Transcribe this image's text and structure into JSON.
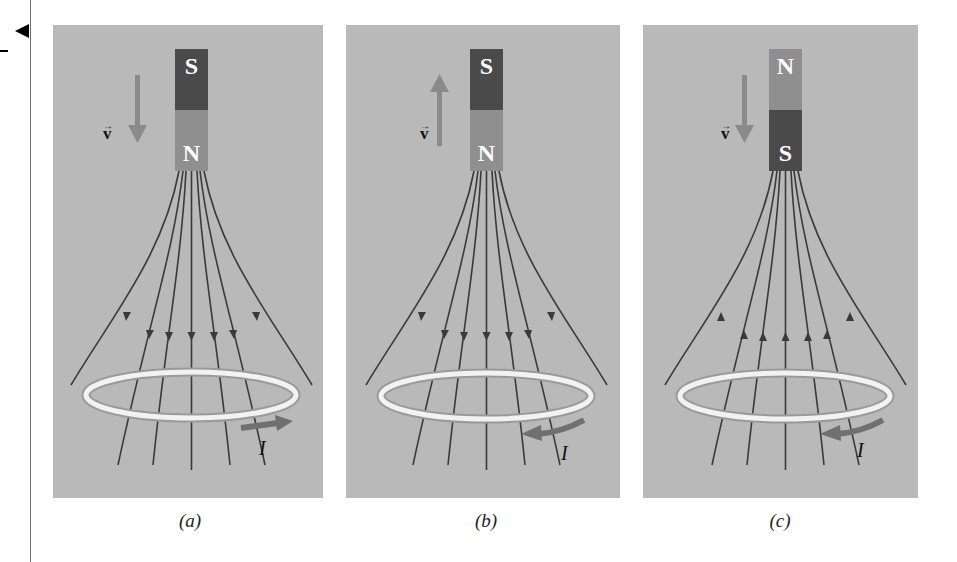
{
  "figure": {
    "panels": [
      {
        "id": "a",
        "caption": "(a)",
        "magnet_top": "S",
        "magnet_bottom": "N",
        "velocity_label": "v",
        "velocity_direction": "down",
        "field_direction": "down",
        "current_label": "I",
        "current_direction": "right"
      },
      {
        "id": "b",
        "caption": "(b)",
        "magnet_top": "S",
        "magnet_bottom": "N",
        "velocity_label": "v",
        "velocity_direction": "up",
        "field_direction": "down",
        "current_label": "I",
        "current_direction": "left"
      },
      {
        "id": "c",
        "caption": "(c)",
        "magnet_top": "N",
        "magnet_bottom": "S",
        "velocity_label": "v",
        "velocity_direction": "down",
        "field_direction": "up",
        "current_label": "I",
        "current_direction": "left"
      }
    ]
  },
  "colors": {
    "panel_bg": "#b9b9b9",
    "magnet_dark": "#4a4a4a",
    "magnet_light": "#8f8f8f",
    "arrow": "#7d7d7d",
    "field_line": "#3a3a3a",
    "ring": "#f2f2f2"
  }
}
